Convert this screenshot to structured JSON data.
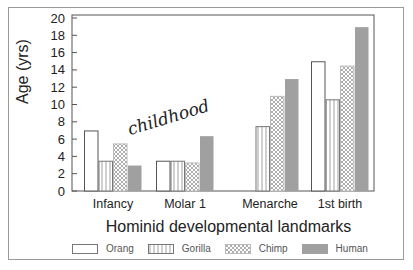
{
  "chart_data": {
    "type": "bar",
    "title": "",
    "xlabel": "Hominid developmental landmarks",
    "ylabel": "Age (yrs)",
    "ylim": [
      0,
      20
    ],
    "yticks": [
      0,
      2,
      4,
      6,
      8,
      10,
      12,
      14,
      16,
      18,
      20
    ],
    "grid": false,
    "legend_position": "bottom",
    "categories": [
      "Infancy",
      "Molar 1",
      "Menarche",
      "1st birth"
    ],
    "series": [
      {
        "name": "Orang",
        "pattern": "open",
        "values": [
          7,
          3.5,
          null,
          15
        ]
      },
      {
        "name": "Gorilla",
        "pattern": "vertical-lines",
        "values": [
          3.5,
          3.5,
          7.5,
          10.6
        ]
      },
      {
        "name": "Chimp",
        "pattern": "crosshatch",
        "values": [
          5.5,
          3.3,
          11,
          14.5
        ]
      },
      {
        "name": "Human",
        "pattern": "solid-gray",
        "color": "#a0a0a0",
        "values": [
          3,
          6.4,
          13,
          19
        ]
      }
    ],
    "annotations": [
      {
        "text": "childhood",
        "near": "between Infancy and Molar 1",
        "style": "italic serif, rotated"
      }
    ]
  },
  "labels": {
    "ylabel": "Age (yrs)",
    "xtitle": "Hominid developmental landmarks",
    "annotation": "childhood"
  },
  "legend": [
    {
      "name": "Orang"
    },
    {
      "name": "Gorilla"
    },
    {
      "name": "Chimp"
    },
    {
      "name": "Human"
    }
  ]
}
